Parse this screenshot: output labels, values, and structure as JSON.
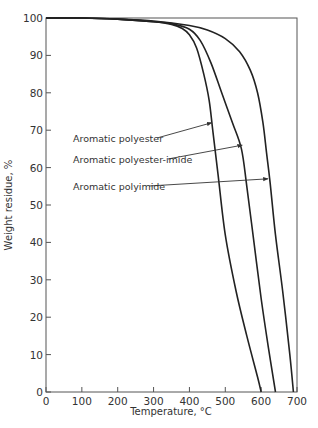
{
  "chart_data": {
    "type": "line",
    "title": "",
    "xlabel": "Temperature, °C",
    "ylabel": "Weight residue, %",
    "xlim": [
      0,
      700
    ],
    "ylim": [
      0,
      100
    ],
    "xticks": [
      0,
      100,
      200,
      300,
      400,
      500,
      600,
      700
    ],
    "yticks": [
      0,
      10,
      20,
      30,
      40,
      50,
      60,
      70,
      80,
      90,
      100
    ],
    "grid": false,
    "legend_position": "annotations with arrows",
    "series": [
      {
        "name": "Aromatic polyester",
        "x": [
          0,
          100,
          200,
          300,
          350,
          380,
          400,
          420,
          440,
          455,
          465,
          480,
          500,
          530,
          560,
          590,
          600
        ],
        "y": [
          100,
          100,
          99.7,
          99,
          98.3,
          97.2,
          95.5,
          92,
          85,
          78,
          70,
          58,
          42,
          27,
          15,
          4,
          0
        ]
      },
      {
        "name": "Aromatic polyester-imide",
        "x": [
          0,
          100,
          200,
          300,
          350,
          400,
          430,
          460,
          490,
          520,
          545,
          560,
          580,
          600,
          620,
          640
        ],
        "y": [
          100,
          100,
          99.7,
          99,
          98.5,
          97,
          94,
          88,
          80,
          72,
          65,
          55,
          40,
          25,
          12,
          0
        ]
      },
      {
        "name": "Aromatic polyimide",
        "x": [
          0,
          100,
          200,
          300,
          400,
          450,
          500,
          540,
          570,
          590,
          605,
          615,
          625,
          640,
          660,
          680,
          690
        ],
        "y": [
          100,
          100,
          99.7,
          99.2,
          98,
          96.8,
          94.5,
          91,
          86,
          80,
          72,
          64,
          56,
          42,
          27,
          10,
          0
        ]
      }
    ],
    "annotations": [
      {
        "text": "Aromatic polyester",
        "points_to": "Aromatic polyester",
        "at": [
          465,
          72
        ]
      },
      {
        "text": "Aromatic polyester-imide",
        "points_to": "Aromatic polyester-imide",
        "at": [
          550,
          66
        ]
      },
      {
        "text": "Aromatic polyimide",
        "points_to": "Aromatic polyimide",
        "at": [
          622,
          57
        ]
      }
    ]
  }
}
